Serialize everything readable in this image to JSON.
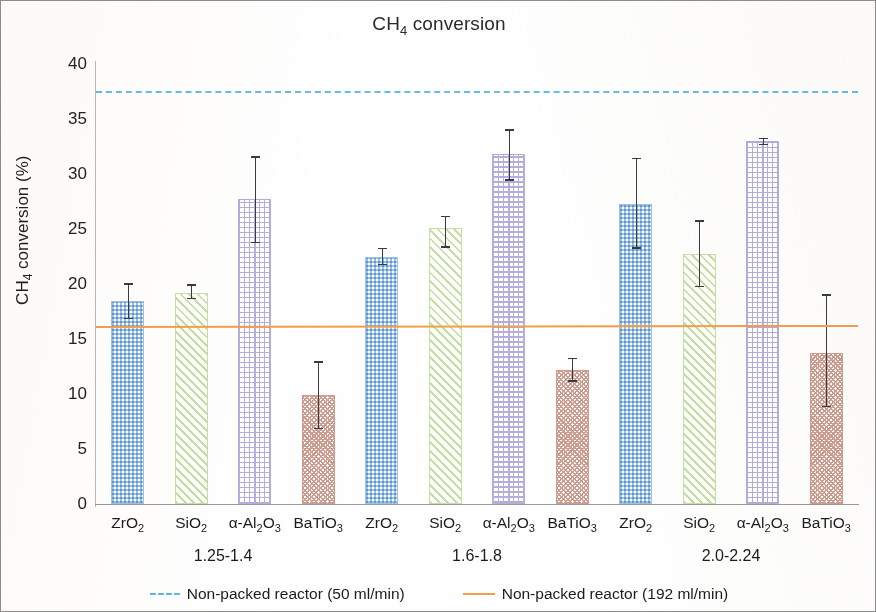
{
  "chart_data": {
    "type": "bar",
    "title": "CH4 conversion",
    "title_html": "CH<sub>4</sub> conversion",
    "xlabel": "",
    "ylabel": "CH4 conversion (%)",
    "ylabel_html": "CH<sub>4</sub> conversion (%)",
    "ylim": [
      0,
      40
    ],
    "ytick_values": [
      40,
      35,
      30,
      25,
      20,
      15,
      10,
      5,
      0
    ],
    "ytick_labels": [
      "40",
      "35",
      "30",
      "25",
      "20",
      "15",
      "10",
      "5",
      "0"
    ],
    "grid": false,
    "legend_position": "bottom",
    "categories": [
      "ZrO2",
      "SiO2",
      "a-Al2O3",
      "BaTiO3",
      "ZrO2",
      "SiO2",
      "a-Al2O3",
      "BaTiO3",
      "ZrO2",
      "SiO2",
      "a-Al2O3",
      "BaTiO3"
    ],
    "category_labels_html": [
      "ZrO<sub>2</sub>",
      "SiO<sub>2</sub>",
      "α-Al<sub>2</sub>O<sub>3</sub>",
      "BaTiO<sub>3</sub>",
      "ZrO<sub>2</sub>",
      "SiO<sub>2</sub>",
      "α-Al<sub>2</sub>O<sub>3</sub>",
      "BaTiO<sub>3</sub>",
      "ZrO<sub>2</sub>",
      "SiO<sub>2</sub>",
      "α-Al<sub>2</sub>O<sub>3</sub>",
      "BaTiO<sub>3</sub>"
    ],
    "group_labels": [
      "1.25-1.4",
      "1.6-1.8",
      "2.0-2.24"
    ],
    "values": [
      18.5,
      19.2,
      27.7,
      9.9,
      22.5,
      25.1,
      31.8,
      12.2,
      27.3,
      22.7,
      33.0,
      13.7
    ],
    "err_low": [
      16.8,
      18.6,
      23.7,
      6.8,
      21.7,
      23.3,
      29.4,
      11.1,
      23.2,
      19.7,
      32.6,
      8.8
    ],
    "err_high": [
      20.1,
      20.0,
      31.6,
      13.0,
      23.3,
      26.2,
      34.1,
      13.3,
      31.5,
      25.8,
      33.3,
      19.1
    ],
    "bar_colors": [
      "#9dc3e6",
      "#c5e0a5",
      "#b4aedd",
      "#cf9d90"
    ],
    "bar_patterns": [
      "checkerboard",
      "diagonal-hatch",
      "cross-grid",
      "speckle"
    ],
    "reference_lines": [
      {
        "name": "Non-packed reactor (50 ml/min)",
        "value": 37.4,
        "style": "dashed",
        "color": "#62b9e0"
      },
      {
        "name": "Non-packed reactor (192 ml/min)",
        "value_start": 16.0,
        "value_end": 16.1,
        "style": "solid",
        "color": "#f0a04b"
      }
    ],
    "legend": [
      {
        "label": "Non-packed reactor (50 ml/min)",
        "style": "dashed",
        "color": "#62b9e0"
      },
      {
        "label": "Non-packed reactor (192 ml/min)",
        "style": "solid",
        "color": "#f0a04b"
      }
    ]
  }
}
